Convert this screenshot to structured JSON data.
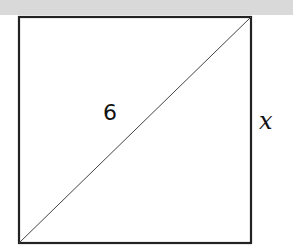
{
  "diagram": {
    "shape": "square",
    "diagonal_label": "6",
    "side_label": "x",
    "colors": {
      "stroke": "#222222",
      "background_strip": "#d9d9d9"
    }
  }
}
